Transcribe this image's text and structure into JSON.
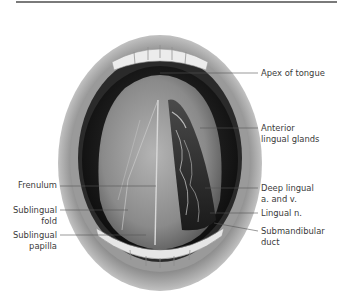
{
  "figure": {
    "title": "",
    "labels_right": [
      {
        "id": "apex",
        "line1": "Apex of tongue",
        "line2": ""
      },
      {
        "id": "glands",
        "line1": "Anterior",
        "line2": "lingual glands"
      },
      {
        "id": "deep",
        "line1": "Deep lingual",
        "line2": "a. and v."
      },
      {
        "id": "nerve",
        "line1": "Lingual n.",
        "line2": ""
      },
      {
        "id": "duct",
        "line1": "Submandibular",
        "line2": "duct"
      }
    ],
    "labels_left": [
      {
        "id": "frenulum",
        "line1": "Frenulum",
        "line2": ""
      },
      {
        "id": "fold",
        "line1": "Sublingual",
        "line2": "fold"
      },
      {
        "id": "papilla",
        "line1": "Sublingual",
        "line2": "papilla"
      }
    ],
    "colors": {
      "rule": "#7a7a7a",
      "leader": "#555555",
      "text": "#3a3a3a"
    }
  }
}
